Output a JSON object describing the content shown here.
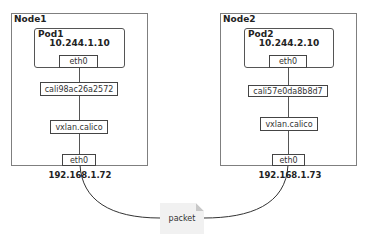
{
  "diagram": {
    "node1": {
      "label": "Node1",
      "pod": {
        "label": "Pod1",
        "ip": "10.244.1.10",
        "eth": "eth0"
      },
      "cali": "cali98ac26a2572",
      "vxlan": "vxlan.calico",
      "eth": "eth0",
      "host_ip": "192.168.1.72"
    },
    "node2": {
      "label": "Node2",
      "pod": {
        "label": "Pod2",
        "ip": "10.244.2.10",
        "eth": "eth0"
      },
      "cali": "cali57e0da8b8d7",
      "vxlan": "vxlan.calico",
      "eth": "eth0",
      "host_ip": "192.168.1.73"
    },
    "packet_label": "packet",
    "colors": {
      "border": "#7f7f7f",
      "line": "#333333",
      "packet_fill": "#f1f1f1"
    }
  }
}
